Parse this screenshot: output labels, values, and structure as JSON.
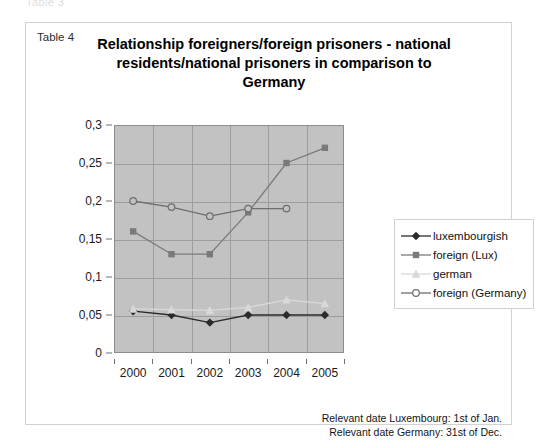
{
  "page": {
    "ghost_text": "Table 3",
    "table_label": "Table 4",
    "title": "Relationship foreigners/foreign prisoners - national residents/national prisoners in comparison to Germany",
    "title_lines": [
      "Relationship foreigners/foreign prisoners - national",
      "residents/national prisoners in comparison to",
      "Germany"
    ],
    "footnotes": [
      "Relevant date Luxembourg: 1st of Jan.",
      "Relevant date Germany: 31st of Dec."
    ]
  },
  "legend": {
    "position": "right",
    "items": [
      {
        "label": "luxembourgish",
        "marker": "diamond-filled",
        "color": "#2b2b2b"
      },
      {
        "label": "foreign (Lux)",
        "marker": "square-filled",
        "color": "#7a7a7a"
      },
      {
        "label": "german",
        "marker": "triangle-filled",
        "color": "#d9d9d9"
      },
      {
        "label": "foreign (Germany)",
        "marker": "circle-open",
        "color": "#6e6e6e"
      }
    ]
  },
  "chart_data": {
    "type": "line",
    "title": "Relationship foreigners/foreign prisoners - national residents/national prisoners in comparison to Germany",
    "xlabel": "",
    "ylabel": "",
    "categories": [
      "2000",
      "2001",
      "2002",
      "2003",
      "2004",
      "2005"
    ],
    "x": [
      2000,
      2001,
      2002,
      2003,
      2004,
      2005
    ],
    "ylim": [
      0,
      0.3
    ],
    "ytick_step": 0.05,
    "ytick_labels": [
      "0",
      "0,05",
      "0,1",
      "0,15",
      "0,2",
      "0,25",
      "0,3"
    ],
    "ytick_values": [
      0,
      0.05,
      0.1,
      0.15,
      0.2,
      0.25,
      0.3
    ],
    "grid": true,
    "decimal_separator": ",",
    "plot_background": "#c2c2c2",
    "series": [
      {
        "name": "luxembourgish",
        "marker": "diamond-filled",
        "color": "#2b2b2b",
        "values": [
          0.055,
          0.05,
          0.04,
          0.05,
          0.05,
          0.05
        ]
      },
      {
        "name": "foreign (Lux)",
        "marker": "square-filled",
        "color": "#7a7a7a",
        "values": [
          0.16,
          0.13,
          0.13,
          0.185,
          0.25,
          0.27
        ]
      },
      {
        "name": "german",
        "marker": "triangle-filled",
        "color": "#d9d9d9",
        "values": [
          0.058,
          0.057,
          0.056,
          0.06,
          0.07,
          0.065
        ]
      },
      {
        "name": "foreign (Germany)",
        "marker": "circle-open",
        "color": "#6e6e6e",
        "values": [
          0.2,
          0.192,
          0.18,
          0.19,
          0.19,
          null
        ]
      }
    ]
  }
}
